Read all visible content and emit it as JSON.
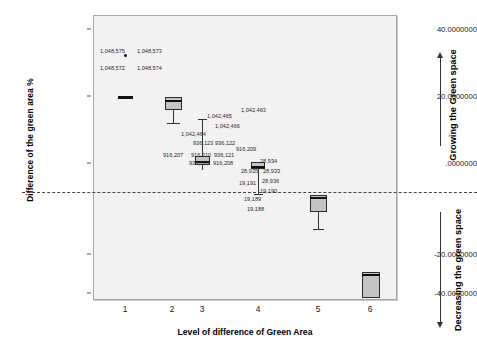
{
  "chart_data": {
    "type": "box",
    "title": "",
    "xlabel": "Level of difference of Green Area",
    "ylabel": "Difference of the green area %",
    "categories": [
      "1",
      "2",
      "3",
      "4",
      "5",
      "6"
    ],
    "ylim": [
      -46,
      46
    ],
    "yticks": [
      "40.0000000",
      "20.0000000",
      ".0000000",
      "-20.0000000",
      "-40.0000000"
    ],
    "ytick_values": [
      40,
      20,
      0,
      -20,
      -40
    ],
    "grid": false,
    "legend": "none",
    "reference_line": {
      "value": -6.4,
      "style": "dashed"
    },
    "boxes": [
      {
        "category": "1",
        "x": 1,
        "median": 22.4,
        "q1": 22.1,
        "q3": 22.7,
        "whisker_low": 22.1,
        "whisker_high": 22.7,
        "outliers": [
          33.5
        ]
      },
      {
        "category": "2",
        "x": 2,
        "median": 18.2,
        "q1": 15.2,
        "q3": 18.9,
        "whisker_low": 11.6,
        "whisker_high": 18.9,
        "outliers": []
      },
      {
        "category": "3",
        "x": 3,
        "median": 1.0,
        "q1": 0.3,
        "q3": 1.8,
        "whisker_low": -1.0,
        "whisker_high": 10.9,
        "outliers": []
      },
      {
        "category": "4",
        "x": 4,
        "median": -0.4,
        "q1": -0.9,
        "q3": 0.2,
        "whisker_low": -6.3,
        "whisker_high": 0.4,
        "outliers": []
      },
      {
        "category": "5",
        "x": 5,
        "median": -5.3,
        "q1": -8.6,
        "q3": -5.0,
        "whisker_low": -13.8,
        "whisker_high": -5.0,
        "outliers": []
      },
      {
        "category": "6",
        "x": 6,
        "median": -28.3,
        "q1": -31.8,
        "q3": -28.0,
        "whisker_low": -31.8,
        "whisker_high": -28.0,
        "outliers": []
      }
    ],
    "point_labels": [
      {
        "text": "1,048,575",
        "x_px": 99,
        "y_px": 48
      },
      {
        "text": "1,048,573",
        "x_px": 136,
        "y_px": 48
      },
      {
        "text": "1,048,572",
        "x_px": 99,
        "y_px": 65
      },
      {
        "text": "1,048,574",
        "x_px": 136,
        "y_px": 65
      },
      {
        "text": "1,042,463",
        "x_px": 240,
        "y_px": 107
      },
      {
        "text": "1,042,465",
        "x_px": 206,
        "y_px": 113
      },
      {
        "text": "1,042,466",
        "x_px": 214,
        "y_px": 123
      },
      {
        "text": "1,042,464",
        "x_px": 180,
        "y_px": 131
      },
      {
        "text": "936,123",
        "x_px": 192,
        "y_px": 140
      },
      {
        "text": "936,122",
        "x_px": 214,
        "y_px": 140
      },
      {
        "text": "916,209",
        "x_px": 235,
        "y_px": 146
      },
      {
        "text": "916,207",
        "x_px": 162,
        "y_px": 152
      },
      {
        "text": "916,210",
        "x_px": 190,
        "y_px": 152
      },
      {
        "text": "936,121",
        "x_px": 213,
        "y_px": 152
      },
      {
        "text": "936,120",
        "x_px": 188,
        "y_px": 160
      },
      {
        "text": "916,208",
        "x_px": 212,
        "y_px": 160
      },
      {
        "text": "28,934",
        "x_px": 259,
        "y_px": 158
      },
      {
        "text": "28,935",
        "x_px": 240,
        "y_px": 168
      },
      {
        "text": "28,933",
        "x_px": 262,
        "y_px": 168
      },
      {
        "text": "28,936",
        "x_px": 261,
        "y_px": 178
      },
      {
        "text": "19,191",
        "x_px": 238,
        "y_px": 180
      },
      {
        "text": "19,190",
        "x_px": 259,
        "y_px": 188
      },
      {
        "text": "19,189",
        "x_px": 243,
        "y_px": 196
      },
      {
        "text": "19,188",
        "x_px": 246,
        "y_px": 206
      }
    ],
    "annotations": [
      {
        "text": "Growing the Green space",
        "direction": "up"
      },
      {
        "text": "Decreasing the green space",
        "direction": "down"
      }
    ],
    "colors": {
      "plot_background": "#f2f2f2",
      "box_fill": "#c4c4c4",
      "box_border": "#2b2b2b",
      "axis": "#555555",
      "text": "#000000"
    }
  }
}
